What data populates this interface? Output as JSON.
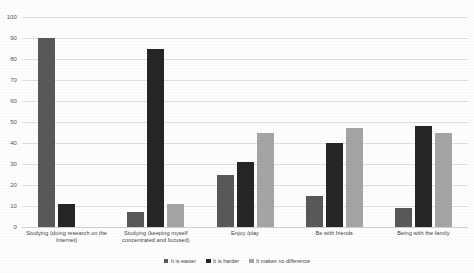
{
  "chart_data": {
    "type": "bar",
    "title": "",
    "subtitle": "",
    "xlabel": "",
    "ylabel": "",
    "ylim": [
      0,
      100
    ],
    "ytick_step": 10,
    "yticks": [
      "100",
      "90",
      "80",
      "70",
      "60",
      "50",
      "40",
      "30",
      "20",
      "10",
      "0"
    ],
    "grid": true,
    "legend_position": "bottom",
    "orientation": "vertical",
    "grouping": "clustered",
    "categories": [
      "Studying (doing research on the Internet)",
      "Studying (keeping myself concentrated and focused)",
      "Enjoy /play",
      "Be with friends",
      "Being with the family"
    ],
    "series": [
      {
        "name": "It is easier",
        "color": "#595959",
        "values": [
          90,
          7,
          25,
          15,
          9
        ]
      },
      {
        "name": "It is harder",
        "color": "#262626",
        "values": [
          11,
          85,
          31,
          40,
          48
        ]
      },
      {
        "name": "It makes no difference",
        "color": "#a6a6a6",
        "values": [
          0,
          11,
          45,
          47,
          45
        ]
      }
    ]
  },
  "legend": {
    "items": [
      {
        "label": "It is easier",
        "color": "#595959"
      },
      {
        "label": "It is harder",
        "color": "#262626"
      },
      {
        "label": "It makes no difference",
        "color": "#a6a6a6"
      }
    ]
  },
  "colors": {
    "background": "#ffffff",
    "gridline": "#e2e2e2",
    "axis_text": "#565656",
    "label_text": "#3f3f3f"
  }
}
